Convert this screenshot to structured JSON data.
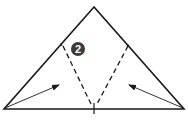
{
  "diagram": {
    "type": "origami-fold-step",
    "step_number": "2",
    "colors": {
      "line": "#1a1a1a",
      "badge_bg": "#3a3a3a",
      "badge_text": "#ffffff",
      "background": "#ffffff"
    },
    "shapes": {
      "triangle": {
        "apex": [
          94,
          7
        ],
        "left": [
          4,
          109
        ],
        "right": [
          184,
          109
        ]
      },
      "valley_folds": [
        {
          "from": [
            63,
            46
          ],
          "to": [
            91,
            104
          ]
        },
        {
          "from": [
            128,
            46
          ],
          "to": [
            97,
            104
          ]
        }
      ],
      "arrows": [
        {
          "from": [
            5,
            108
          ],
          "to": [
            59,
            85
          ]
        },
        {
          "from": [
            183,
            108
          ],
          "to": [
            129,
            85
          ]
        }
      ],
      "center_mark": {
        "from": [
          94,
          103
        ],
        "to": [
          94,
          114
        ]
      }
    }
  }
}
